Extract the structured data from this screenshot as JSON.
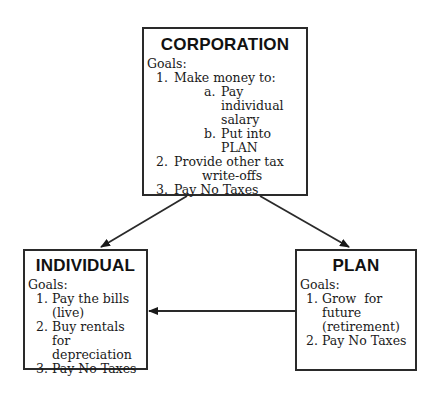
{
  "diagram": {
    "corporation": {
      "title": "CORPORATION",
      "goals_label": "Goals:",
      "items": [
        {
          "num": "1.",
          "text": "Make money to:"
        },
        {
          "num": "a.",
          "text": "Pay individual"
        },
        {
          "num": "",
          "text": "salary"
        },
        {
          "num": "b.",
          "text": "Put into PLAN"
        },
        {
          "num": "2.",
          "text": "Provide other tax"
        },
        {
          "num": "",
          "text": "write-offs"
        },
        {
          "num": "3.",
          "text": "Pay No Taxes"
        }
      ]
    },
    "individual": {
      "title": "INDIVIDUAL",
      "goals_label": "Goals:",
      "items": [
        {
          "num": "1.",
          "text": "Pay the bills"
        },
        {
          "num": "",
          "text": "(live)"
        },
        {
          "num": "2.",
          "text": "Buy rentals for"
        },
        {
          "num": "",
          "text": "depreciation"
        },
        {
          "num": "3.",
          "text": "Pay No Taxes"
        }
      ]
    },
    "plan": {
      "title": "PLAN",
      "goals_label": "Goals:",
      "items": [
        {
          "num": "1.",
          "text": "Grow  for"
        },
        {
          "num": "",
          "text": "future"
        },
        {
          "num": "",
          "text": "(retirement)"
        },
        {
          "num": "2.",
          "text": "Pay No Taxes"
        }
      ]
    },
    "edges": [
      {
        "from": "CORPORATION",
        "to": "INDIVIDUAL"
      },
      {
        "from": "CORPORATION",
        "to": "PLAN"
      },
      {
        "from": "PLAN",
        "to": "INDIVIDUAL"
      }
    ],
    "colors": {
      "stroke": "#2a2a2a",
      "background": "#ffffff",
      "text": "#1a1a1a"
    }
  }
}
